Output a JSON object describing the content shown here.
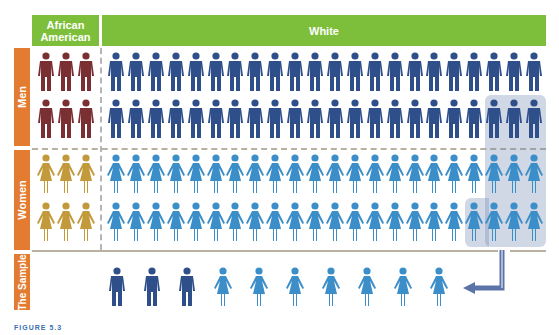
{
  "header": {
    "african_american": "African American",
    "white": "White"
  },
  "side_labels": {
    "men": "Men",
    "women": "Women",
    "sample": "The Sample"
  },
  "colors": {
    "header_green": "#7dbf3a",
    "side_orange": "#e37b30",
    "aa_men": "#7a2f33",
    "white_men": "#2f4f8a",
    "aa_women": "#c29a3c",
    "white_women": "#3c8ec8",
    "highlight": "#a9b7cf",
    "arrow": "#5a74a8"
  },
  "population": {
    "african_american_men": 6,
    "white_men": 44,
    "african_american_women": 6,
    "white_women": 44,
    "columns_african_american": 3,
    "columns_white": 22,
    "rows_per_gender": 2
  },
  "highlighted_selection": {
    "men_row2_last": 3,
    "women_row1_last": 3,
    "women_row2_last": 4
  },
  "sample": {
    "men": 3,
    "women": 7,
    "total": 10
  },
  "caption": "FIGURE 5.3"
}
